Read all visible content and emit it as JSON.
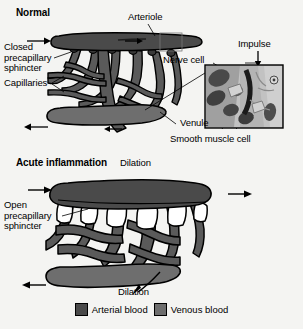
{
  "figure": {
    "title_normal": "Normal",
    "title_acute": "Acute inflammation"
  },
  "colors": {
    "background": "#f4f4f2",
    "arterial_blood": "#4a4a4a",
    "venous_blood": "#6e6e6e",
    "outline": "#000000",
    "capillary_fill": "#5a5a5a",
    "inset_light": "#c9c9c9",
    "inset_mid": "#8e8e8e",
    "inset_dark": "#2e2e2e"
  },
  "panels": {
    "normal": {
      "heading": "Normal",
      "labels": {
        "arteriole": "Arteriole",
        "closed_sphincter": "Closed\nprecapillary\nsphincter",
        "capillaries": "Capillaries",
        "venule": "Venule",
        "nerve_cell": "Nerve cell",
        "impulse": "Impulse",
        "smooth_muscle_cell": "Smooth muscle cell"
      },
      "flow_arrows": [
        {
          "name": "inflow-arrow",
          "direction": "right"
        },
        {
          "name": "arteriole-flow-arrow",
          "direction": "right"
        },
        {
          "name": "outflow-arrow",
          "direction": "left"
        },
        {
          "name": "venule-flow-arrow",
          "direction": "left"
        },
        {
          "name": "impulse-arrow",
          "direction": "down"
        }
      ]
    },
    "acute": {
      "heading": "Acute inflammation",
      "labels": {
        "dilation_top": "Dilation",
        "open_sphincter": "Open\nprecapillary\nsphincter",
        "dilation_bottom": "Dilation"
      },
      "flow_arrows": [
        {
          "name": "inflow-arrow",
          "direction": "right"
        },
        {
          "name": "outflow-right-arrow",
          "direction": "right"
        },
        {
          "name": "outflow-left-arrow",
          "direction": "left"
        },
        {
          "name": "venule-flow-arrow",
          "direction": "left-curved"
        }
      ]
    }
  },
  "legend": {
    "items": [
      {
        "label": "Arterial blood",
        "color": "#4a4a4a",
        "name": "legend-arterial"
      },
      {
        "label": "Venous blood",
        "color": "#6e6e6e",
        "name": "legend-venous"
      }
    ]
  }
}
